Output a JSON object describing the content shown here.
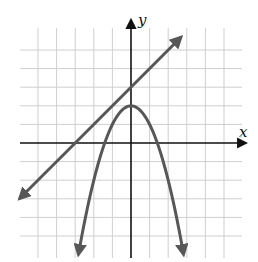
{
  "chart_data": {
    "type": "line",
    "title": "",
    "xlabel": "x",
    "ylabel": "y",
    "xlim": [
      -6,
      6
    ],
    "ylim": [
      -6,
      6.5
    ],
    "grid": true,
    "grid_spacing": 1,
    "tick_labels": false,
    "legend": null,
    "series": [
      {
        "name": "line",
        "equation": "y = x + 3",
        "slope": 1,
        "y_intercept": 3,
        "x_intercept": -3,
        "x": [
          -6.0,
          2.7
        ],
        "y": [
          -3.0,
          5.7
        ],
        "arrows_both_ends": true
      },
      {
        "name": "parabola",
        "equation": "y = 2 - x^2",
        "vertex": [
          0,
          2
        ],
        "x_intercepts": [
          -1.41,
          1.41
        ],
        "x": [
          -2.83,
          -2,
          -1.41,
          -1,
          0,
          1,
          1.41,
          2,
          2.83
        ],
        "y": [
          -6,
          -2,
          0,
          1,
          2,
          1,
          0,
          -2,
          -6
        ],
        "arrows_both_ends": true
      }
    ]
  },
  "colors": {
    "curve": "#575757",
    "grid": "#cfcfcf",
    "axis": "#111111"
  },
  "labels": {
    "x_axis": "x",
    "y_axis": "y"
  }
}
